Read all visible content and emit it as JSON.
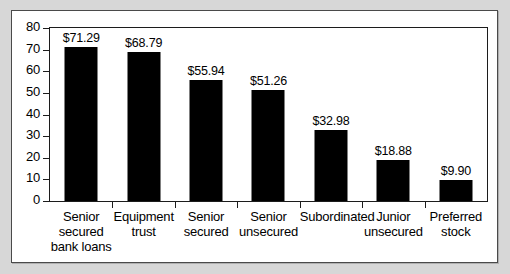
{
  "chart_data": {
    "type": "bar",
    "title": "",
    "subtitle": "",
    "xlabel": "",
    "ylabel": "",
    "ylim": [
      0,
      80
    ],
    "ytick_values": [
      80,
      70,
      60,
      50,
      40,
      30,
      20,
      10,
      0
    ],
    "ytick_labels": [
      "80",
      "70",
      "60",
      "50",
      "40",
      "30",
      "20",
      "10",
      "0"
    ],
    "grid": false,
    "legend": false,
    "legend_position": "none",
    "bar_color": "#000000",
    "plot_background": "#ffffff",
    "figure_background": "#d7d7d7",
    "axis_color": "#1c1c1c",
    "categories": [
      "Senior secured bank loans",
      "Equipment trust",
      "Senior secured",
      "Senior unsecured",
      "Subordinated",
      "Junior unsecured",
      "Preferred stock"
    ],
    "category_lines": [
      [
        "Senior",
        "secured",
        "bank loans"
      ],
      [
        "Equipment",
        "trust"
      ],
      [
        "Senior",
        "secured"
      ],
      [
        "Senior",
        "unsecured"
      ],
      [
        "Subordinated"
      ],
      [
        "Junior",
        "unsecured"
      ],
      [
        "Preferred",
        "stock"
      ]
    ],
    "values": [
      71.29,
      68.79,
      55.94,
      51.26,
      32.98,
      18.88,
      9.9
    ],
    "data_labels": [
      "$71.29",
      "$68.79",
      "$55.94",
      "$51.26",
      "$32.98",
      "$18.88",
      "$9.90"
    ]
  }
}
